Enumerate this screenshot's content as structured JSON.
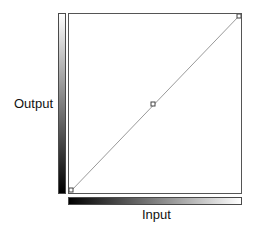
{
  "curves": {
    "y_axis_label": "Output",
    "x_axis_label": "Input",
    "points": [
      {
        "input": 0,
        "output": 0
      },
      {
        "input": 128,
        "output": 128
      },
      {
        "input": 255,
        "output": 255
      }
    ],
    "colors": {
      "curve_line": "#9a9a9a",
      "point_fill": "#ffffff",
      "point_stroke": "#444444",
      "frame": "#555555"
    }
  }
}
